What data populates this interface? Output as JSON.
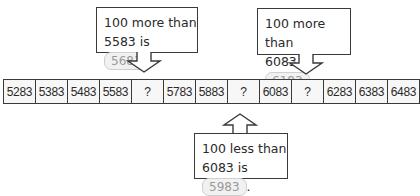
{
  "callouts": [
    {
      "line1": "100 more than",
      "line2_prefix": "5583 is",
      "answer": "5683",
      "suffix": "."
    },
    {
      "line1": "100 more than",
      "line2_prefix": "6083 is",
      "answer": "6183",
      "suffix": "."
    },
    {
      "line1": "100 less than",
      "line2_prefix": "6083 is",
      "answer": "5983",
      "suffix": "."
    }
  ],
  "sequence": [
    "5283",
    "5383",
    "5483",
    "5583",
    "?",
    "5783",
    "5883",
    "?",
    "6083",
    "?",
    "6283",
    "6383",
    "6483"
  ]
}
